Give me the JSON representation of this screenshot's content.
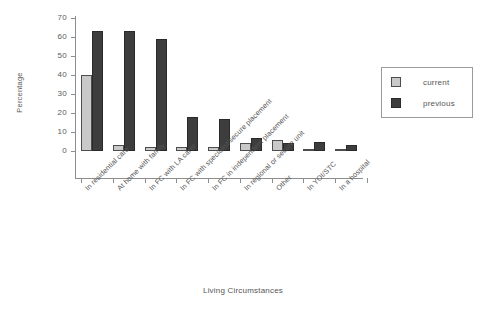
{
  "chart_data": {
    "type": "bar",
    "title": "",
    "xlabel": "Living Circumstances",
    "ylabel": "Percentage",
    "ylim": [
      0,
      70
    ],
    "yticks": [
      0,
      10,
      20,
      30,
      40,
      50,
      60,
      70
    ],
    "grid": false,
    "legend_position": "right",
    "categories": [
      "In residential care",
      "At home with family",
      "In FC with LA carer",
      "In FC with specialist/secure placement",
      "In FC in independent placement",
      "In regional or secure unit",
      "Other",
      "In YOI/STC",
      "In a hospital"
    ],
    "series": [
      {
        "name": "current",
        "color": "#c9c9c9",
        "values": [
          40,
          3,
          2,
          2,
          2,
          4,
          6,
          1,
          1
        ]
      },
      {
        "name": "previous",
        "color": "#3d3d3d",
        "values": [
          63,
          63,
          59,
          18,
          17,
          7,
          4,
          5,
          3
        ]
      }
    ]
  },
  "legend": {
    "items": [
      {
        "label": "current"
      },
      {
        "label": "previous"
      }
    ]
  }
}
